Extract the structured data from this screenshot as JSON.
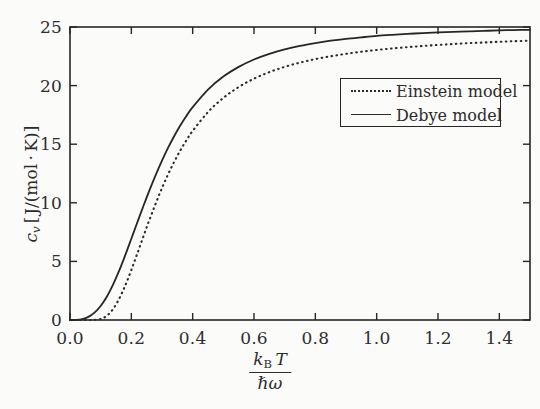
{
  "chart_data": {
    "type": "line",
    "title": "",
    "xlabel": "k_B T / (hbar omega)",
    "xlabel_numerator": "kʙ T",
    "xlabel_denominator": "ħω",
    "ylabel": "cᵥ [J/(mol·K)]",
    "xlim": [
      0.0,
      1.5
    ],
    "ylim": [
      0,
      25
    ],
    "xticks": [
      0.0,
      0.2,
      0.4,
      0.6,
      0.8,
      1.0,
      1.2,
      1.4
    ],
    "xtick_labels": [
      "0.0",
      "0.2",
      "0.4",
      "0.6",
      "0.8",
      "1.0",
      "1.2",
      "1.4"
    ],
    "yticks": [
      0,
      5,
      10,
      15,
      20,
      25
    ],
    "ytick_labels": [
      "0",
      "5",
      "10",
      "15",
      "20",
      "25"
    ],
    "grid": false,
    "legend_position": "upper right",
    "x": [
      0.0,
      0.02,
      0.04,
      0.06,
      0.08,
      0.1,
      0.12,
      0.14,
      0.16,
      0.18,
      0.2,
      0.22,
      0.24,
      0.26,
      0.28,
      0.3,
      0.32,
      0.34,
      0.36,
      0.38,
      0.4,
      0.45,
      0.5,
      0.55,
      0.6,
      0.65,
      0.7,
      0.75,
      0.8,
      0.85,
      0.9,
      0.95,
      1.0,
      1.05,
      1.1,
      1.15,
      1.2,
      1.25,
      1.3,
      1.35,
      1.4,
      1.45,
      1.5
    ],
    "series": [
      {
        "name": "Debye model",
        "style": "solid",
        "color": "#262626",
        "values": [
          0.0,
          0.01,
          0.08,
          0.27,
          0.63,
          1.2,
          1.99,
          3.0,
          4.19,
          5.52,
          6.93,
          8.36,
          9.77,
          11.13,
          12.41,
          13.6,
          14.7,
          15.7,
          16.61,
          17.43,
          18.16,
          19.66,
          20.77,
          21.6,
          22.23,
          22.71,
          23.09,
          23.39,
          23.63,
          23.83,
          23.99,
          24.12,
          24.24,
          24.33,
          24.41,
          24.48,
          24.54,
          24.59,
          24.63,
          24.67,
          24.71,
          24.74,
          24.76
        ]
      },
      {
        "name": "Einstein model",
        "style": "dotted",
        "color": "#2b2b2b",
        "values": [
          0.0,
          0.0,
          0.0,
          0.0,
          0.01,
          0.09,
          0.36,
          0.92,
          1.79,
          2.93,
          4.27,
          5.71,
          7.18,
          8.61,
          9.98,
          11.26,
          12.44,
          13.51,
          14.48,
          15.35,
          16.13,
          17.74,
          18.95,
          19.88,
          20.59,
          21.15,
          21.6,
          21.96,
          22.26,
          22.5,
          22.71,
          22.89,
          23.04,
          23.17,
          23.28,
          23.38,
          23.47,
          23.55,
          23.62,
          23.68,
          23.74,
          23.79,
          23.83
        ]
      }
    ]
  },
  "legend": {
    "items": [
      {
        "label": "Einstein model",
        "style": "dotted"
      },
      {
        "label": "Debye model",
        "style": "solid"
      }
    ]
  }
}
